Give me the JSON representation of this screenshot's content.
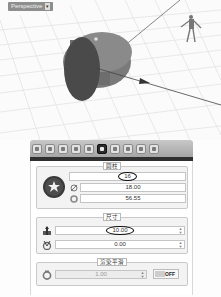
{
  "viewport": {
    "label": "Perspective",
    "dropdown_arrow": "▾",
    "grid": "on",
    "objects": [
      "cylinder",
      "human-figure-reference",
      "axis-arrow"
    ]
  },
  "toolbar": {
    "tools": [
      {
        "name": "tool-1",
        "active": false
      },
      {
        "name": "tool-2",
        "active": false
      },
      {
        "name": "tool-3",
        "active": false
      },
      {
        "name": "tool-4",
        "active": false
      },
      {
        "name": "tool-5",
        "active": false
      },
      {
        "name": "tool-6",
        "active": true
      },
      {
        "name": "tool-7",
        "active": false
      },
      {
        "name": "tool-8",
        "active": false
      },
      {
        "name": "tool-9",
        "active": false
      },
      {
        "name": "tool-10",
        "active": false
      }
    ]
  },
  "cylinder_group": {
    "title": "圆柱",
    "segments": "16",
    "diameter": "18.00",
    "circumference": "56.55"
  },
  "size_group": {
    "title": "尺寸",
    "height": "10.00",
    "angle": "0.00",
    "spin_up": "▲",
    "spin_down": "▼"
  },
  "smooth_group": {
    "title": "渲染平滑",
    "value": "1.00",
    "toggle_label": "OFF"
  }
}
